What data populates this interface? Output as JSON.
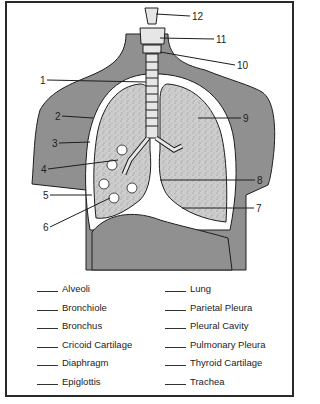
{
  "diagram": {
    "colors": {
      "body": "#8f8f8f",
      "lung": "#c8c8c8",
      "outline": "#1e1e1e",
      "pleura": "#ffffff"
    },
    "labels": [
      {
        "number": "1",
        "x": 40,
        "y": 76
      },
      {
        "number": "2",
        "x": 55,
        "y": 112
      },
      {
        "number": "3",
        "x": 52,
        "y": 139
      },
      {
        "number": "4",
        "x": 41,
        "y": 165
      },
      {
        "number": "5",
        "x": 43,
        "y": 191
      },
      {
        "number": "6",
        "x": 43,
        "y": 223
      },
      {
        "number": "7",
        "x": 256,
        "y": 204
      },
      {
        "number": "8",
        "x": 257,
        "y": 176
      },
      {
        "number": "9",
        "x": 243,
        "y": 114
      },
      {
        "number": "10",
        "x": 237,
        "y": 61
      },
      {
        "number": "11",
        "x": 216,
        "y": 35
      },
      {
        "number": "12",
        "x": 192,
        "y": 12
      }
    ]
  },
  "word_bank": {
    "left": [
      "Alveoli",
      "Bronchiole",
      "Bronchus",
      "Cricoid Cartilage",
      "Diaphragm",
      "Epiglottis"
    ],
    "right": [
      "Lung",
      "Parietal Pleura",
      "Pleural Cavity",
      "Pulmonary Pleura",
      "Thyroid Cartilage",
      "Trachea"
    ]
  }
}
